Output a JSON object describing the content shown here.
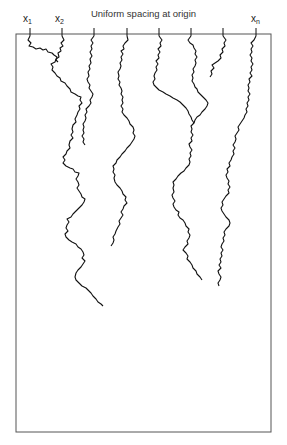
{
  "diagram": {
    "title": "Uniform spacing at origin",
    "labels": [
      {
        "base": "x",
        "sub": "1"
      },
      {
        "base": "x",
        "sub": "2"
      },
      {
        "base": "x",
        "sub": "n"
      }
    ],
    "frame": {
      "left": 16,
      "top": 34,
      "right": 271,
      "bottom": 432
    },
    "origin_count": 8,
    "origin_x": [
      30,
      62,
      94,
      127,
      159,
      191,
      223,
      256
    ],
    "line_color": "#111111",
    "surviving_paths_at_bottom": 2
  }
}
